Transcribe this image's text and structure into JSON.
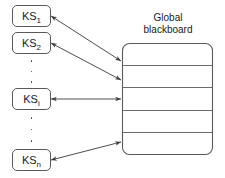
{
  "diagram": {
    "title_lines": [
      "Global",
      "blackboard"
    ],
    "knowledge_sources": [
      {
        "name": "ks-1",
        "base": "KS",
        "sub": "1"
      },
      {
        "name": "ks-2",
        "base": "KS",
        "sub": "2"
      },
      {
        "name": "ks-i",
        "base": "KS",
        "sub": "i"
      },
      {
        "name": "ks-n",
        "base": "KS",
        "sub": "n"
      }
    ],
    "ellipsis_groups": [
      {
        "name": "ellipsis-upper",
        "dots": 3
      },
      {
        "name": "ellipsis-lower",
        "dots": 3
      }
    ],
    "blackboard": {
      "partitions": 5,
      "divider_count": 4
    },
    "connectors": [
      {
        "name": "connector-ks-1",
        "from": "ks-1",
        "to": "blackboard",
        "arrowheads": "both"
      },
      {
        "name": "connector-ks-2",
        "from": "ks-2",
        "to": "blackboard",
        "arrowheads": "both"
      },
      {
        "name": "connector-ks-i",
        "from": "ks-i",
        "to": "blackboard",
        "arrowheads": "both"
      },
      {
        "name": "connector-ks-n",
        "from": "ks-n",
        "to": "blackboard",
        "arrowheads": "both"
      }
    ],
    "colors": {
      "background": "#ffffff",
      "stroke": "#5a5a5a",
      "text": "#1a1a1a",
      "arrow": "#3a3a3a"
    }
  }
}
